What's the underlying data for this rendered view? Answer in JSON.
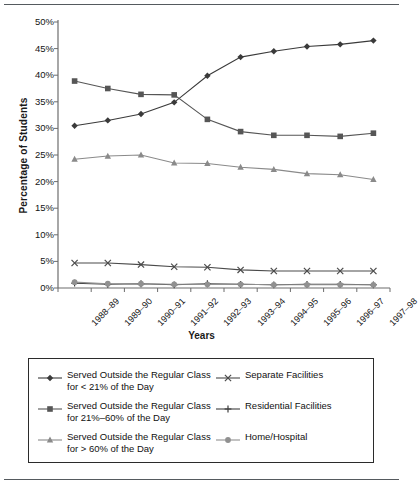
{
  "chart_data": {
    "type": "line",
    "title": "",
    "xlabel": "Years",
    "ylabel": "Percentage of Students",
    "ylim": [
      0,
      50
    ],
    "ytick_labels": [
      "0%",
      "5%",
      "10%",
      "15%",
      "20%",
      "25%",
      "30%",
      "35%",
      "40%",
      "45%",
      "50%"
    ],
    "ytick_values": [
      0,
      5,
      10,
      15,
      20,
      25,
      30,
      35,
      40,
      45,
      50
    ],
    "grid": false,
    "legend_position": "below-plot",
    "categories": [
      "1988–89",
      "1989–90",
      "1990–91",
      "1991–92",
      "1992–93",
      "1993–94",
      "1994–95",
      "1995–96",
      "1996–97",
      "1997–98"
    ],
    "series": [
      {
        "name": "Served Outside the Regular Class\nfor < 21% of the Day",
        "marker": "diamond",
        "color": "#3a3a3a",
        "values": [
          30.5,
          31.5,
          32.7,
          34.9,
          39.9,
          43.4,
          44.5,
          45.4,
          45.8,
          46.5
        ]
      },
      {
        "name": "Served Outside the Regular Class\nfor 21%–60% of the Day",
        "marker": "square",
        "color": "#565656",
        "values": [
          38.9,
          37.5,
          36.4,
          36.3,
          31.7,
          29.4,
          28.7,
          28.7,
          28.5,
          29.1
        ]
      },
      {
        "name": "Served Outside the Regular Class\nfor > 60% of the Day",
        "marker": "triangle",
        "color": "#8a8a8a",
        "values": [
          24.2,
          24.8,
          25.0,
          23.5,
          23.4,
          22.7,
          22.3,
          21.5,
          21.3,
          20.4
        ]
      },
      {
        "name": "Separate Facilities",
        "marker": "x",
        "color": "#4a4a4a",
        "values": [
          4.7,
          4.7,
          4.4,
          4.0,
          3.9,
          3.4,
          3.2,
          3.2,
          3.2,
          3.2
        ]
      },
      {
        "name": "Residential Facilities",
        "marker": "plus",
        "color": "#3f3f3f",
        "values": [
          0.9,
          0.7,
          0.8,
          0.6,
          0.8,
          0.7,
          0.6,
          0.7,
          0.7,
          0.6
        ]
      },
      {
        "name": "Home/Hospital",
        "marker": "circle",
        "color": "#909090",
        "values": [
          1.1,
          0.8,
          0.8,
          0.7,
          0.7,
          0.7,
          0.6,
          0.6,
          0.6,
          0.6
        ]
      }
    ]
  },
  "legend": {
    "items": [
      {
        "label": "Served Outside the Regular Class\nfor < 21% of the Day",
        "marker": "diamond"
      },
      {
        "label": "Served Outside the Regular Class\nfor 21%–60% of the Day",
        "marker": "square"
      },
      {
        "label": "Served Outside the Regular Class\nfor > 60% of the Day",
        "marker": "triangle"
      },
      {
        "label": "Separate Facilities",
        "marker": "x"
      },
      {
        "label": "Residential Facilities",
        "marker": "plus"
      },
      {
        "label": "Home/Hospital",
        "marker": "circle"
      }
    ]
  },
  "colors": {
    "axis": "#6d6d6d",
    "text": "#141414",
    "rule": "#555a5e",
    "series_dark": "#3a3a3a",
    "series_mid": "#565656",
    "series_light": "#8a8a8a"
  }
}
